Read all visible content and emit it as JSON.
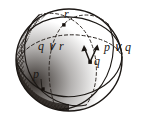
{
  "figure": {
    "kind": "sphere-diagram",
    "background_color": "#ffffff",
    "ink_color": "#1b1714",
    "shading_color": "#2a2420",
    "sphere": {
      "center_x": 69,
      "center_y": 60,
      "radius_x": 53,
      "radius_y": 51
    },
    "labels": {
      "point_r": "r",
      "point_q": "q",
      "point_p": "p",
      "join_q_r": "q ∨ r",
      "join_p_q": "p ∨ q"
    },
    "marked_points": [
      {
        "name": "r",
        "x": 64,
        "y": 25
      },
      {
        "name": "q",
        "x": 90,
        "y": 62
      },
      {
        "name": "p",
        "x": 43,
        "y": 89
      }
    ],
    "arrow_tips": [
      {
        "name": "arrow-to-q-join-r",
        "x": 84,
        "y": 46
      },
      {
        "name": "arrow-to-p-join-q",
        "x": 97,
        "y": 45
      }
    ],
    "great_circles": [
      {
        "name": "circle-through-p-and-q",
        "style": "solid-with-hidden-dashed"
      },
      {
        "name": "circle-through-q-and-r",
        "style": "solid-with-hidden-dashed"
      },
      {
        "name": "circle-through-p-and-r",
        "style": "solid-with-hidden-dashed"
      }
    ]
  }
}
